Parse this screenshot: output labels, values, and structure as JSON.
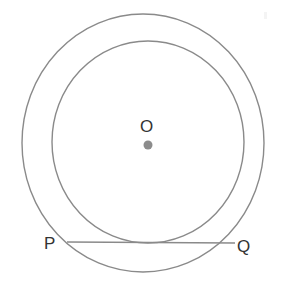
{
  "figure": {
    "background_color": "#ffffff",
    "stroke_color": "#8a8a8a",
    "label_color": "#333333",
    "center_dot_color": "#8c8c8c",
    "labels": {
      "center": "O",
      "chord_left": "P",
      "chord_right": "Q"
    },
    "shapes": {
      "outer_circle": {
        "name": "outer-circle",
        "cx": 143,
        "cy": 143,
        "rx": 121,
        "ry": 129,
        "stroke_width": 1.4
      },
      "inner_circle": {
        "name": "inner-circle",
        "cx": 148,
        "cy": 142,
        "rx": 96,
        "ry": 101,
        "stroke_width": 1.4
      },
      "center_dot": {
        "name": "center-point-O",
        "cx": 148,
        "cy": 145,
        "r": 4.5
      },
      "chord": {
        "name": "chord-PQ",
        "x1": 67,
        "y1": 242,
        "x2": 235,
        "y2": 243,
        "stroke_width": 1.4
      }
    }
  }
}
